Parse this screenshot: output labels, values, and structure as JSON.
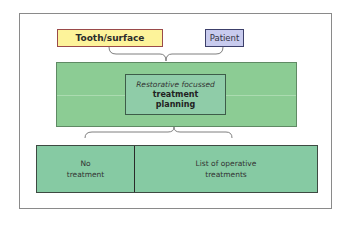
{
  "diagram": {
    "inputs": [
      {
        "label": "Tooth/surface",
        "color": "#fdf39a",
        "border": "#9a4a4a"
      },
      {
        "label": "Patient",
        "color": "#c8cbee",
        "border": "#3c3f6a"
      }
    ],
    "center": {
      "line1": "Restorative focussed",
      "line2": "treatment",
      "line3": "planning",
      "outer_color": "#8ccc94",
      "inner_color": "#8fcca8"
    },
    "outputs": [
      {
        "line1": "No",
        "line2": "treatment"
      },
      {
        "line1": "List of operative",
        "line2": "treatments"
      }
    ],
    "output_color": "#86caa3"
  }
}
